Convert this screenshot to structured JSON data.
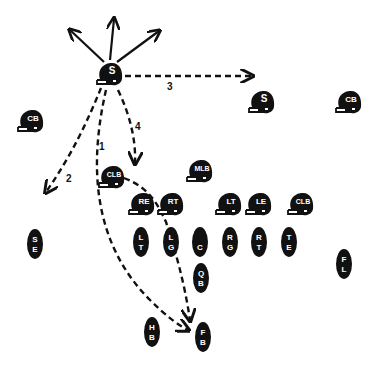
{
  "diagram": {
    "ink": "#111111",
    "background": "#ffffff"
  },
  "defense": [
    {
      "id": "s-blitz",
      "label": "S",
      "x": 110,
      "y": 75
    },
    {
      "id": "s-right",
      "label": "S",
      "x": 262,
      "y": 103
    },
    {
      "id": "cb-right",
      "label": "CB",
      "x": 349,
      "y": 103
    },
    {
      "id": "cb-left",
      "label": "CB",
      "x": 31,
      "y": 122
    },
    {
      "id": "mlb",
      "label": "MLB",
      "x": 200,
      "y": 172
    },
    {
      "id": "clb-left",
      "label": "CLB",
      "x": 112,
      "y": 178
    },
    {
      "id": "re",
      "label": "RE",
      "x": 142,
      "y": 205
    },
    {
      "id": "rt",
      "label": "RT",
      "x": 171,
      "y": 205
    },
    {
      "id": "lt",
      "label": "LT",
      "x": 229,
      "y": 205
    },
    {
      "id": "le",
      "label": "LE",
      "x": 259,
      "y": 205
    },
    {
      "id": "clb-right",
      "label": "CLB",
      "x": 301,
      "y": 205
    }
  ],
  "offense": [
    {
      "id": "se",
      "l1": "S",
      "l2": "E",
      "x": 35,
      "y": 244
    },
    {
      "id": "lt-off",
      "l1": "L",
      "l2": "T",
      "x": 141,
      "y": 242
    },
    {
      "id": "lg",
      "l1": "L",
      "l2": "G",
      "x": 171,
      "y": 242
    },
    {
      "id": "c",
      "l1": "",
      "l2": "C",
      "x": 200,
      "y": 242
    },
    {
      "id": "rg",
      "l1": "R",
      "l2": "G",
      "x": 230,
      "y": 242
    },
    {
      "id": "rt-off",
      "l1": "R",
      "l2": "T",
      "x": 259,
      "y": 242
    },
    {
      "id": "te",
      "l1": "T",
      "l2": "E",
      "x": 289,
      "y": 242
    },
    {
      "id": "qb",
      "l1": "Q",
      "l2": "B",
      "x": 201,
      "y": 278
    },
    {
      "id": "fl",
      "l1": "F",
      "l2": "L",
      "x": 344,
      "y": 264
    },
    {
      "id": "hb",
      "l1": "H",
      "l2": "B",
      "x": 152,
      "y": 332
    },
    {
      "id": "fb",
      "l1": "F",
      "l2": "B",
      "x": 203,
      "y": 337
    }
  ],
  "routes": [
    {
      "id": "route-1",
      "label": "1",
      "label_x": 99,
      "label_y": 150
    },
    {
      "id": "route-2",
      "label": "2",
      "label_x": 66,
      "label_y": 182
    },
    {
      "id": "route-3",
      "label": "3",
      "label_x": 167,
      "label_y": 90
    },
    {
      "id": "route-4",
      "label": "4",
      "label_x": 135,
      "label_y": 130
    }
  ]
}
